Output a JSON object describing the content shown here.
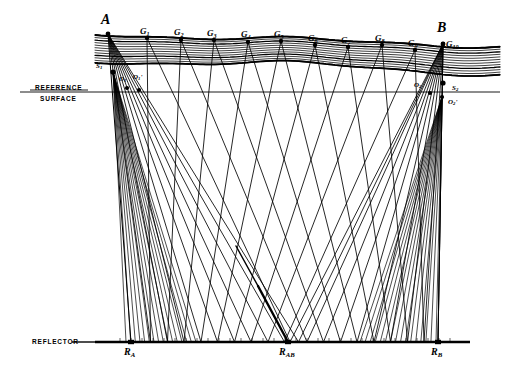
{
  "figure": {
    "type": "seismic-raypath-diagram",
    "width": 510,
    "height": 380,
    "background": "#ffffff",
    "ink": "#000000"
  },
  "annotations": {
    "reference_surface_line1": "REFERENCE",
    "reference_surface_line2": "SURFACE",
    "reflector_label": "REFLECTOR"
  },
  "sources": [
    {
      "id": "A",
      "label": "A",
      "x": 108,
      "y": 34,
      "label_x": 101,
      "label_y": 12
    },
    {
      "id": "B",
      "label": "B",
      "x": 443,
      "y": 44,
      "label_x": 437,
      "label_y": 20
    }
  ],
  "geophones": [
    {
      "id": "G1",
      "label": "G",
      "sub": "1",
      "x": 147,
      "y": 38,
      "label_x": 140,
      "label_y": 26
    },
    {
      "id": "G2",
      "label": "G",
      "sub": "2",
      "x": 181,
      "y": 40,
      "label_x": 174,
      "label_y": 27
    },
    {
      "id": "G3",
      "label": "G",
      "sub": "3",
      "x": 214,
      "y": 40,
      "label_x": 207,
      "label_y": 28
    },
    {
      "id": "G4",
      "label": "G",
      "sub": "4",
      "x": 248,
      "y": 42,
      "label_x": 241,
      "label_y": 29
    },
    {
      "id": "G5",
      "label": "G",
      "sub": "5",
      "x": 281,
      "y": 41,
      "label_x": 274,
      "label_y": 29
    },
    {
      "id": "G6",
      "label": "G",
      "sub": "6",
      "x": 315,
      "y": 45,
      "label_x": 308,
      "label_y": 33
    },
    {
      "id": "G7",
      "label": "G",
      "sub": "7",
      "x": 348,
      "y": 47,
      "label_x": 341,
      "label_y": 35
    },
    {
      "id": "G8",
      "label": "G",
      "sub": "8",
      "x": 382,
      "y": 45,
      "label_x": 375,
      "label_y": 33
    },
    {
      "id": "G9",
      "label": "G",
      "sub": "9",
      "x": 415,
      "y": 50,
      "label_x": 408,
      "label_y": 38
    },
    {
      "id": "G10",
      "label": "G",
      "sub": "10",
      "x": 443,
      "y": 44,
      "label_x": 446,
      "label_y": 39
    }
  ],
  "station_points": [
    {
      "id": "S1",
      "label": "S",
      "sub": "1",
      "x": 113,
      "y": 72,
      "label_x": 96,
      "label_y": 62
    },
    {
      "id": "O1",
      "label": "O",
      "sub": "1",
      "x": 127,
      "y": 88,
      "label_x": 119,
      "label_y": 75
    },
    {
      "id": "O1p",
      "label": "O",
      "sub": "1",
      "prime": true,
      "x": 139,
      "y": 90,
      "label_x": 133,
      "label_y": 73
    },
    {
      "id": "O2",
      "label": "O",
      "sub": "2",
      "x": 430,
      "y": 93,
      "label_x": 414,
      "label_y": 81
    },
    {
      "id": "S2",
      "label": "S",
      "sub": "2",
      "x": 443,
      "y": 83,
      "label_x": 452,
      "label_y": 84
    },
    {
      "id": "O2p",
      "label": "O",
      "sub": "2",
      "prime": true,
      "x": 442,
      "y": 97,
      "label_x": 448,
      "label_y": 98
    }
  ],
  "reference_surface": {
    "y": 92,
    "x_start": 20,
    "x_end": 500,
    "label_x": 35,
    "label_y1": 84,
    "label_y2": 95
  },
  "reflector": {
    "y": 342,
    "x_start": 95,
    "x_end": 470,
    "label_x": 32,
    "label_y": 338,
    "points": [
      {
        "id": "RA",
        "label": "R",
        "sub": "A",
        "x": 131,
        "label_x": 124,
        "label_y": 346
      },
      {
        "id": "RAB",
        "label": "R",
        "sub": "AB",
        "x": 288,
        "label_x": 279,
        "label_y": 346
      },
      {
        "id": "RB",
        "label": "R",
        "sub": "B",
        "x": 438,
        "label_x": 431,
        "label_y": 346
      }
    ]
  },
  "weathering_layer": {
    "description": "hatched near-surface layer band",
    "top_y_left": 34,
    "top_y_right": 46,
    "thickness": 26,
    "hatch_lines": 11
  },
  "ray_fans": [
    {
      "origin": "S1",
      "x": 113,
      "y": 72,
      "count": 16,
      "target_x_min": 126,
      "target_x_max": 196,
      "target_y": 342
    },
    {
      "origin": "S2",
      "x": 442,
      "y": 97,
      "count": 16,
      "target_x_min": 360,
      "target_x_max": 436,
      "target_y": 342
    }
  ],
  "highlighted_ray": {
    "from_x": 258,
    "from_y": 286,
    "to_x": 288,
    "to_y": 342,
    "weight": "bold"
  },
  "ray_count_total": 44
}
